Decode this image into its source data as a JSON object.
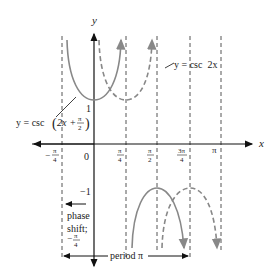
{
  "diagram": {
    "axes": {
      "x_label": "x",
      "y_label": "y",
      "x_ticks": [
        "−π/4",
        "0",
        "π/4",
        "π/2",
        "3π/4",
        "π"
      ],
      "y_ticks": [
        "1",
        "−1"
      ]
    },
    "curves": [
      {
        "name": "shifted",
        "label": "y = csc (2x + π/2)",
        "style": "solid",
        "color": "#888888"
      },
      {
        "name": "base",
        "label": "y = csc  2x",
        "style": "dashed",
        "color": "#888888"
      }
    ],
    "annotations": {
      "phase_shift_line1": "phase",
      "phase_shift_line2": "shift;",
      "phase_shift_value": "−π/4",
      "period": "period π"
    },
    "labels": {
      "y_eq": "y = csc",
      "shifted_arg_2x": "2x",
      "plus": "+",
      "pi": "π",
      "two": "2",
      "base_label": "y = csc  2x",
      "x": "x",
      "y": "y",
      "zero": "0",
      "one": "1",
      "neg_one": "−1",
      "four": "4",
      "three_pi": "3π",
      "minus": "−"
    }
  }
}
